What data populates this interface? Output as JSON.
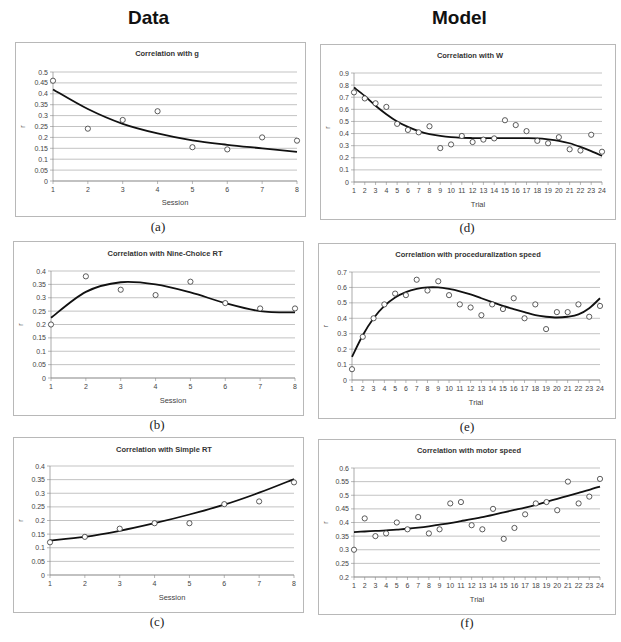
{
  "headers": {
    "left": "Data",
    "right": "Model"
  },
  "chart_data": [
    {
      "id": "a",
      "type": "scatter",
      "title": "Correlation with g",
      "xlabel": "Session",
      "ylabel": "r",
      "caption": "(a)",
      "x": [
        1,
        2,
        3,
        4,
        5,
        6,
        7,
        8
      ],
      "values": [
        0.46,
        0.24,
        0.28,
        0.32,
        0.155,
        0.145,
        0.2,
        0.185
      ],
      "fit": [
        0.42,
        0.33,
        0.262,
        0.218,
        0.186,
        0.166,
        0.15,
        0.134
      ],
      "ylim": [
        0,
        0.5
      ],
      "yticks": [
        "0",
        "0.05",
        "0.1",
        "0.15",
        "0.2",
        "0.25",
        "0.3",
        "0.35",
        "0.4",
        "0.45",
        "0.5"
      ],
      "xticks": [
        "1",
        "2",
        "3",
        "4",
        "5",
        "6",
        "7",
        "8"
      ],
      "grid": true,
      "legend": "none"
    },
    {
      "id": "b",
      "type": "scatter",
      "title": "Correlation with Nine-Choice RT",
      "xlabel": "Session",
      "ylabel": "r",
      "caption": "(b)",
      "x": [
        1,
        2,
        3,
        4,
        5,
        6,
        7,
        8
      ],
      "values": [
        0.2,
        0.38,
        0.33,
        0.31,
        0.36,
        0.28,
        0.26,
        0.26
      ],
      "fit": [
        0.225,
        0.322,
        0.358,
        0.35,
        0.32,
        0.28,
        0.25,
        0.245
      ],
      "ylim": [
        0,
        0.4
      ],
      "yticks": [
        "0",
        "0.05",
        "0.1",
        "0.15",
        "0.2",
        "0.25",
        "0.3",
        "0.35",
        "0.4"
      ],
      "xticks": [
        "1",
        "2",
        "3",
        "4",
        "5",
        "6",
        "7",
        "8"
      ],
      "grid": true,
      "legend": "none"
    },
    {
      "id": "c",
      "type": "scatter",
      "title": "Correlation with Simple RT",
      "xlabel": "Session",
      "ylabel": "r",
      "caption": "(c)",
      "x": [
        1,
        2,
        3,
        4,
        5,
        6,
        7,
        8
      ],
      "values": [
        0.12,
        0.14,
        0.17,
        0.19,
        0.19,
        0.26,
        0.27,
        0.34
      ],
      "fit": [
        0.127,
        0.14,
        0.162,
        0.19,
        0.222,
        0.258,
        0.302,
        0.352
      ],
      "ylim": [
        0,
        0.4
      ],
      "yticks": [
        "0",
        "0.05",
        "0.1",
        "0.15",
        "0.2",
        "0.25",
        "0.3",
        "0.35",
        "0.4"
      ],
      "xticks": [
        "1",
        "2",
        "3",
        "4",
        "5",
        "6",
        "7",
        "8"
      ],
      "grid": true,
      "legend": "none"
    },
    {
      "id": "d",
      "type": "scatter",
      "title": "Correlation with W",
      "xlabel": "Trial",
      "ylabel": "r",
      "caption": "(d)",
      "x": [
        1,
        2,
        3,
        4,
        5,
        6,
        7,
        8,
        9,
        10,
        11,
        12,
        13,
        14,
        15,
        16,
        17,
        18,
        19,
        20,
        21,
        22,
        23,
        24
      ],
      "values": [
        0.74,
        0.69,
        0.65,
        0.62,
        0.48,
        0.43,
        0.41,
        0.46,
        0.28,
        0.31,
        0.38,
        0.33,
        0.35,
        0.36,
        0.51,
        0.47,
        0.42,
        0.34,
        0.32,
        0.37,
        0.27,
        0.26,
        0.39,
        0.25
      ],
      "fit": [
        0.78,
        0.71,
        0.63,
        0.56,
        0.5,
        0.455,
        0.42,
        0.395,
        0.38,
        0.37,
        0.365,
        0.363,
        0.362,
        0.362,
        0.362,
        0.362,
        0.362,
        0.36,
        0.352,
        0.34,
        0.32,
        0.29,
        0.255,
        0.215
      ],
      "ylim": [
        0,
        0.9
      ],
      "yticks": [
        "0",
        "0.1",
        "0.2",
        "0.3",
        "0.4",
        "0.5",
        "0.6",
        "0.7",
        "0.8",
        "0.9"
      ],
      "xticks": [
        "1",
        "2",
        "3",
        "4",
        "5",
        "6",
        "7",
        "8",
        "9",
        "10",
        "11",
        "12",
        "13",
        "14",
        "15",
        "16",
        "17",
        "18",
        "19",
        "20",
        "21",
        "22",
        "23",
        "24"
      ],
      "grid": true,
      "legend": "none"
    },
    {
      "id": "e",
      "type": "scatter",
      "title": "Correlation with proceduralization speed",
      "xlabel": "Trial",
      "ylabel": "r",
      "caption": "(e)",
      "x": [
        1,
        2,
        3,
        4,
        5,
        6,
        7,
        8,
        9,
        10,
        11,
        12,
        13,
        14,
        15,
        16,
        17,
        18,
        19,
        20,
        21,
        22,
        23,
        24
      ],
      "values": [
        0.07,
        0.28,
        0.4,
        0.49,
        0.56,
        0.55,
        0.65,
        0.58,
        0.64,
        0.55,
        0.49,
        0.47,
        0.42,
        0.49,
        0.46,
        0.53,
        0.4,
        0.49,
        0.33,
        0.44,
        0.44,
        0.49,
        0.41,
        0.48
      ],
      "fit": [
        0.15,
        0.29,
        0.4,
        0.48,
        0.535,
        0.57,
        0.59,
        0.6,
        0.6,
        0.59,
        0.575,
        0.555,
        0.53,
        0.505,
        0.48,
        0.46,
        0.44,
        0.42,
        0.41,
        0.405,
        0.41,
        0.425,
        0.465,
        0.53
      ],
      "ylim": [
        0,
        0.7
      ],
      "yticks": [
        "0",
        "0.1",
        "0.2",
        "0.3",
        "0.4",
        "0.5",
        "0.6",
        "0.7"
      ],
      "xticks": [
        "1",
        "2",
        "3",
        "4",
        "5",
        "6",
        "7",
        "8",
        "9",
        "10",
        "11",
        "12",
        "13",
        "14",
        "15",
        "16",
        "17",
        "18",
        "19",
        "20",
        "21",
        "22",
        "23",
        "24"
      ],
      "grid": true,
      "legend": "none"
    },
    {
      "id": "f",
      "type": "scatter",
      "title": "Correlation with motor speed",
      "xlabel": "Trial",
      "ylabel": "r",
      "caption": "(f)",
      "x": [
        1,
        2,
        3,
        4,
        5,
        6,
        7,
        8,
        9,
        10,
        11,
        12,
        13,
        14,
        15,
        16,
        17,
        18,
        19,
        20,
        21,
        22,
        23,
        24
      ],
      "values": [
        0.3,
        0.415,
        0.35,
        0.36,
        0.4,
        0.375,
        0.42,
        0.36,
        0.375,
        0.47,
        0.475,
        0.39,
        0.375,
        0.45,
        0.34,
        0.38,
        0.43,
        0.47,
        0.475,
        0.445,
        0.55,
        0.47,
        0.495,
        0.56
      ],
      "fit": [
        0.365,
        0.367,
        0.369,
        0.371,
        0.374,
        0.377,
        0.381,
        0.386,
        0.392,
        0.398,
        0.405,
        0.412,
        0.42,
        0.428,
        0.437,
        0.446,
        0.455,
        0.465,
        0.476,
        0.487,
        0.498,
        0.509,
        0.52,
        0.532
      ],
      "ylim": [
        0.2,
        0.6
      ],
      "yticks": [
        "0.2",
        "0.25",
        "0.3",
        "0.35",
        "0.4",
        "0.45",
        "0.5",
        "0.55",
        "0.6"
      ],
      "xticks": [
        "1",
        "2",
        "3",
        "4",
        "5",
        "6",
        "7",
        "8",
        "9",
        "10",
        "11",
        "12",
        "13",
        "14",
        "15",
        "16",
        "17",
        "18",
        "19",
        "20",
        "21",
        "22",
        "23",
        "24"
      ],
      "grid": true,
      "legend": "none"
    }
  ]
}
